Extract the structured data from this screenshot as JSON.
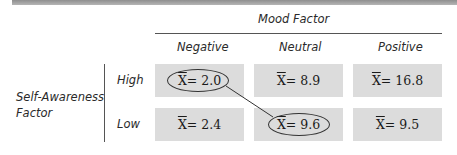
{
  "table": {
    "column_factor": "Mood Factor",
    "row_factor": "Self-Awareness Factor",
    "row_factor_line1": "Self-Awareness",
    "row_factor_line2": "Factor",
    "columns": [
      "Negative",
      "Neutral",
      "Positive"
    ],
    "rows": [
      {
        "label": "High",
        "cells": [
          {
            "symbol": "X",
            "text": " = 2.0",
            "value": 2.0,
            "circled": true
          },
          {
            "symbol": "X",
            "text": " = 8.9",
            "value": 8.9,
            "circled": false
          },
          {
            "symbol": "X",
            "text": " = 16.8",
            "value": 16.8,
            "circled": false
          }
        ]
      },
      {
        "label": "Low",
        "cells": [
          {
            "symbol": "X",
            "text": " = 2.4",
            "value": 2.4,
            "circled": false
          },
          {
            "symbol": "X",
            "text": " = 9.6",
            "value": 9.6,
            "circled": true
          },
          {
            "symbol": "X",
            "text": " = 9.5",
            "value": 9.5,
            "circled": false
          }
        ]
      }
    ],
    "annotation": "Line connects circled means: High/Negative (2.0) and Low/Neutral (9.6)"
  },
  "colors": {
    "cell_fill": "#dcdcdc",
    "rule": "#555555",
    "top_bar": "#a0a0a0"
  }
}
